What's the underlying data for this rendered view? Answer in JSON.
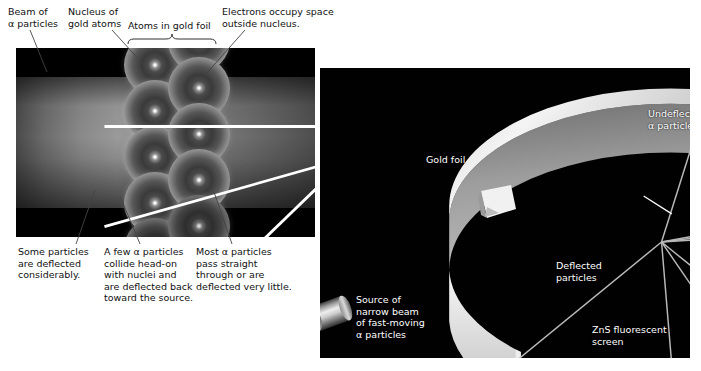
{
  "figure": {
    "background_color": "#ffffff",
    "panel_background_color": "#000000",
    "label_text_color": "#111111",
    "panel_label_text_color": "#ffffff"
  },
  "left_panel": {
    "name": "atomic-scale view of alpha particles passing through gold foil",
    "labels_top": [
      {
        "id": "beam",
        "text": "Beam of\nα particles"
      },
      {
        "id": "nucleus",
        "text": "Nucleus of\ngold atoms"
      },
      {
        "id": "atoms",
        "text": "Atoms in gold foil"
      },
      {
        "id": "electrons",
        "text": "Electrons occupy space\noutside nucleus."
      }
    ],
    "labels_bottom": [
      {
        "id": "deflected-considerably",
        "text": "Some particles\nare deflected\nconsiderably."
      },
      {
        "id": "head-on",
        "text": "A few α particles\ncollide head-on\nwith nuclei and\nare deflected back\ntoward the source."
      },
      {
        "id": "straight-through",
        "text": "Most α particles\npass straight\nthrough or are\ndeflected very little."
      }
    ],
    "bracket": {
      "id": "atoms-bracket",
      "spans_label": "Atoms in gold foil"
    },
    "atoms": {
      "column_1_count": 4,
      "column_2_count": 4,
      "nucleus_appearance": "small bright white dot at center of each atom",
      "electron_cloud_appearance": "diffuse glowing sphere"
    },
    "trajectories": [
      {
        "id": "undeflected-upper",
        "kind": "straight-through",
        "direction": "left-to-right"
      },
      {
        "id": "undeflected-lower",
        "kind": "straight-through",
        "direction": "left-to-right"
      },
      {
        "id": "deflected-up",
        "kind": "deflected",
        "direction": "up-right"
      },
      {
        "id": "deflected-down",
        "kind": "deflected",
        "direction": "down-right"
      },
      {
        "id": "backscattered-left",
        "kind": "back-scattered",
        "direction": "down-left"
      },
      {
        "id": "backscattered-reverse",
        "kind": "back-scattered",
        "direction": "right-to-left"
      }
    ]
  },
  "right_panel": {
    "name": "apparatus view: alpha source, gold foil and circular ZnS detector screen",
    "labels": [
      {
        "id": "undeflected",
        "text": "Undeflected\nα particles"
      },
      {
        "id": "gold-foil",
        "text": "Gold foil"
      },
      {
        "id": "deflected",
        "text": "Deflected\nparticles"
      },
      {
        "id": "zns-screen",
        "text": "ZnS fluorescent\nscreen"
      },
      {
        "id": "source",
        "text": "Source of\nnarrow beam\nof fast-moving\nα particles"
      }
    ],
    "components": {
      "source": "lead cylinder emitting narrow alpha beam",
      "foil": "thin square gold foil at ring centre",
      "screen": "circular zinc sulfide fluorescent screen ring with gap",
      "scintillation_spots": 4
    }
  }
}
